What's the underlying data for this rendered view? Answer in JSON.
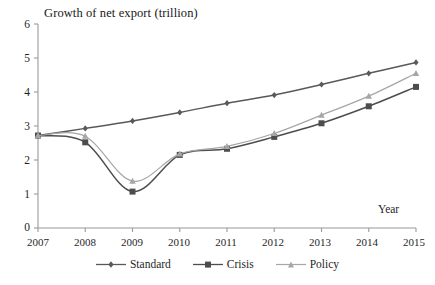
{
  "chart_data": {
    "type": "line",
    "title": "Growth of net export (trillion)",
    "xlabel": "Year",
    "ylabel": "",
    "categories": [
      "2007",
      "2008",
      "2009",
      "2010",
      "2011",
      "2012",
      "2013",
      "2014",
      "2015"
    ],
    "x": [
      2007,
      2008,
      2009,
      2010,
      2011,
      2012,
      2013,
      2014,
      2015
    ],
    "xlim": [
      2007,
      2015
    ],
    "ylim": [
      0,
      6
    ],
    "yticks": [
      0,
      1,
      2,
      3,
      4,
      5,
      6
    ],
    "ytick_labels": [
      "0",
      "1",
      "2",
      "3",
      "4",
      "5",
      "6"
    ],
    "grid": false,
    "legend_position": "bottom",
    "series": [
      {
        "name": "Standard",
        "marker": "diamond",
        "color": "#595959",
        "values": [
          2.72,
          2.93,
          3.15,
          3.4,
          3.67,
          3.91,
          4.22,
          4.55,
          4.87
        ]
      },
      {
        "name": "Crisis",
        "marker": "square",
        "color": "#4d4d4d",
        "values": [
          2.72,
          2.52,
          1.07,
          2.15,
          2.33,
          2.68,
          3.08,
          3.58,
          4.15
        ]
      },
      {
        "name": "Policy",
        "marker": "triangle",
        "color": "#a6a6a6",
        "values": [
          2.72,
          2.7,
          1.38,
          2.18,
          2.4,
          2.78,
          3.32,
          3.88,
          4.55
        ]
      }
    ]
  },
  "axis": {
    "y_labels": [
      "6",
      "5",
      "4",
      "3",
      "2",
      "1",
      "0"
    ],
    "x_labels": [
      "2007",
      "2008",
      "2009",
      "2010",
      "2011",
      "2012",
      "2013",
      "2014",
      "2015"
    ],
    "x_title": "Year"
  },
  "legend": {
    "items": [
      {
        "label": "Standard"
      },
      {
        "label": "Crisis"
      },
      {
        "label": "Policy"
      }
    ]
  },
  "colors": {
    "standard": "#595959",
    "crisis": "#4d4d4d",
    "policy": "#a6a6a6",
    "axis": "#8c8c8c",
    "text": "#1f1f1f",
    "background": "#ffffff"
  }
}
